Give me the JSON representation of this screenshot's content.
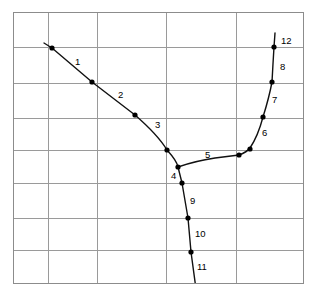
{
  "figure": {
    "title": "",
    "background_color": "#ffffff",
    "frame_color": "#8c8c8c",
    "grid_color": "#9a9a9a",
    "curve_color": "#111111",
    "dot_color": "#000000",
    "label_color": "#000000"
  },
  "chart_data": {
    "type": "line",
    "title": "",
    "xlabel": "",
    "ylabel": "",
    "grid": true,
    "legend": "none",
    "axis_ticks_visible": false,
    "xlim": [
      13,
      303
    ],
    "ylim": [
      12,
      283
    ],
    "grid_x": [
      13,
      48,
      97,
      166,
      236,
      303
    ],
    "grid_y": [
      12,
      47,
      83,
      118,
      150,
      183,
      218,
      250,
      283
    ],
    "annotations": [
      {
        "label": "1",
        "x": 75,
        "y": 62
      },
      {
        "label": "2",
        "x": 118,
        "y": 95
      },
      {
        "label": "3",
        "x": 155,
        "y": 125
      },
      {
        "label": "4",
        "x": 171,
        "y": 176
      },
      {
        "label": "5",
        "x": 205,
        "y": 155
      },
      {
        "label": "6",
        "x": 262,
        "y": 133
      },
      {
        "label": "7",
        "x": 272,
        "y": 100
      },
      {
        "label": "8",
        "x": 280,
        "y": 67
      },
      {
        "label": "9",
        "x": 190,
        "y": 201
      },
      {
        "label": "10",
        "x": 195,
        "y": 234
      },
      {
        "label": "11",
        "x": 197,
        "y": 267
      },
      {
        "label": "12",
        "x": 281,
        "y": 41
      }
    ],
    "series": [
      {
        "name": "upper-left-branch",
        "path": "M 44,43 L 52,48 L 92,82 L 135,115 Q 158,135 167,150 Q 177,161 178,167",
        "points": [
          {
            "x": 52,
            "y": 48
          },
          {
            "x": 92,
            "y": 82
          },
          {
            "x": 135,
            "y": 115
          },
          {
            "x": 167,
            "y": 150
          },
          {
            "x": 178,
            "y": 167
          }
        ]
      },
      {
        "name": "lower-branch",
        "path": "M 178,167 L 182,183 L 188,218 L 191,252 L 196,289",
        "points": [
          {
            "x": 182,
            "y": 183
          },
          {
            "x": 188,
            "y": 218
          },
          {
            "x": 191,
            "y": 252
          }
        ]
      },
      {
        "name": "right-branch",
        "path": "M 178,167 Q 195,161 215,158 Q 231,156 239,155 Q 247,152 250,148 Q 258,136 263,117 Q 269,98 272,82 Q 273,63 274,47 L 275,33",
        "points": [
          {
            "x": 239,
            "y": 155
          },
          {
            "x": 250,
            "y": 149
          },
          {
            "x": 263,
            "y": 117
          },
          {
            "x": 272,
            "y": 82
          },
          {
            "x": 274,
            "y": 47
          }
        ]
      }
    ]
  }
}
